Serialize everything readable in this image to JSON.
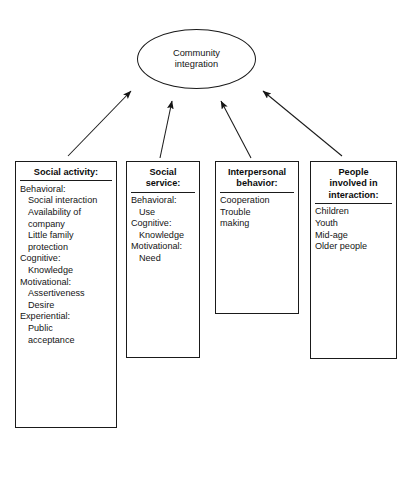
{
  "diagram": {
    "type": "influence-diagram",
    "central_node": {
      "name": "community-integration",
      "lines": [
        "Community",
        "integration"
      ]
    },
    "boxes": [
      {
        "id": "social-activity",
        "title_lines": [
          "Social activity:"
        ],
        "items": [
          {
            "text": "Behavioral:",
            "level": 1
          },
          {
            "text": "Social interaction",
            "level": 2
          },
          {
            "text": "Availability of",
            "level": 2
          },
          {
            "text": "company",
            "level": 2
          },
          {
            "text": "Little family",
            "level": 2
          },
          {
            "text": "protection",
            "level": 2
          },
          {
            "text": "Cognitive:",
            "level": 1
          },
          {
            "text": "Knowledge",
            "level": 2
          },
          {
            "text": "Motivational:",
            "level": 1
          },
          {
            "text": "Assertiveness",
            "level": 2
          },
          {
            "text": "Desire",
            "level": 2
          },
          {
            "text": "Experiential:",
            "level": 1
          },
          {
            "text": "Public",
            "level": 2
          },
          {
            "text": "acceptance",
            "level": 2
          }
        ]
      },
      {
        "id": "social-service",
        "title_lines": [
          "Social",
          "service:"
        ],
        "items": [
          {
            "text": "Behavioral:",
            "level": 1
          },
          {
            "text": "Use",
            "level": 2
          },
          {
            "text": "Cognitive:",
            "level": 1
          },
          {
            "text": "Knowledge",
            "level": 2
          },
          {
            "text": "Motivational:",
            "level": 1
          },
          {
            "text": "Need",
            "level": 2
          }
        ]
      },
      {
        "id": "interpersonal-behavior",
        "title_lines": [
          "Interpersonal",
          "behavior:"
        ],
        "items": [
          {
            "text": "Cooperation",
            "level": 1
          },
          {
            "text": "Trouble",
            "level": 1
          },
          {
            "text": "making",
            "level": 1
          }
        ]
      },
      {
        "id": "people-involved",
        "title_lines": [
          "People",
          "involved in",
          "interaction:"
        ],
        "items": [
          {
            "text": "Children",
            "level": 1
          },
          {
            "text": "Youth",
            "level": 1
          },
          {
            "text": "Mid-age",
            "level": 1
          },
          {
            "text": "Older people",
            "level": 1
          }
        ]
      }
    ],
    "arrows": [
      {
        "name": "arrow-social-activity-to-center",
        "x1": 68,
        "y1": 156,
        "x2": 131,
        "y2": 91
      },
      {
        "name": "arrow-social-service-to-center",
        "x1": 160,
        "y1": 158,
        "x2": 172,
        "y2": 101
      },
      {
        "name": "arrow-interpersonal-behavior-to-center",
        "x1": 251,
        "y1": 158,
        "x2": 221,
        "y2": 101
      },
      {
        "name": "arrow-people-involved-to-center",
        "x1": 342,
        "y1": 156,
        "x2": 263,
        "y2": 91
      }
    ],
    "colors": {
      "stroke": "#1a1a1a",
      "text": "#141414",
      "background": "#ffffff"
    }
  }
}
